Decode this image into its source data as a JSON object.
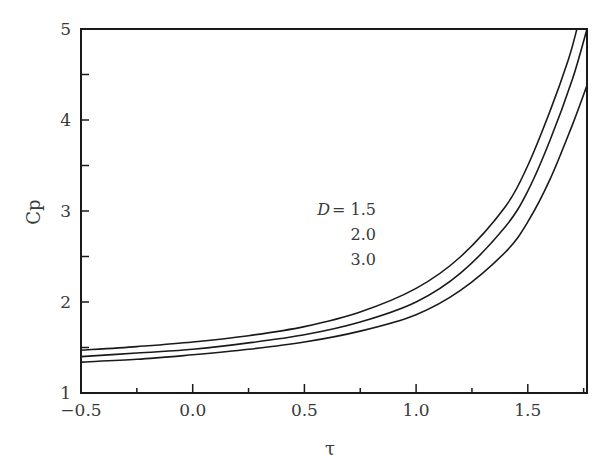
{
  "chart_data": {
    "type": "line",
    "title": "",
    "xlabel": "τ",
    "ylabel": "Cp",
    "xlim": [
      -0.5,
      1.765
    ],
    "ylim": [
      1,
      5
    ],
    "xticks": [
      -0.5,
      0.0,
      0.5,
      1.0,
      1.5
    ],
    "xtick_labels": [
      "−0.5",
      "0.0",
      "0.5",
      "1.0",
      "1.5"
    ],
    "yticks": [
      1,
      2,
      3,
      4,
      5
    ],
    "ytick_labels": [
      "1",
      "2",
      "3",
      "4",
      "5"
    ],
    "x_minor_step": 0.25,
    "y_minor_step": 0.5,
    "grid": false,
    "legend": "inline annotation",
    "annotation": {
      "prefix": "D",
      "equals": "= 1.5",
      "lines": [
        "2.0",
        "3.0"
      ]
    },
    "series": [
      {
        "name": "D = 1.5",
        "x": [
          -0.5,
          -0.25,
          0.0,
          0.25,
          0.5,
          0.75,
          1.0,
          1.2,
          1.4,
          1.5,
          1.6,
          1.68,
          1.72
        ],
        "y": [
          1.47,
          1.51,
          1.56,
          1.63,
          1.73,
          1.89,
          2.15,
          2.5,
          3.05,
          3.5,
          4.1,
          4.65,
          5.0
        ]
      },
      {
        "name": "D = 2.0",
        "x": [
          -0.5,
          -0.25,
          0.0,
          0.25,
          0.5,
          0.75,
          1.0,
          1.2,
          1.4,
          1.5,
          1.6,
          1.7,
          1.765
        ],
        "y": [
          1.4,
          1.44,
          1.48,
          1.55,
          1.64,
          1.78,
          2.0,
          2.32,
          2.83,
          3.22,
          3.78,
          4.45,
          5.0
        ]
      },
      {
        "name": "D = 3.0",
        "x": [
          -0.5,
          -0.25,
          0.0,
          0.25,
          0.5,
          0.75,
          1.0,
          1.2,
          1.4,
          1.5,
          1.6,
          1.7,
          1.765
        ],
        "y": [
          1.34,
          1.37,
          1.42,
          1.48,
          1.56,
          1.68,
          1.86,
          2.13,
          2.55,
          2.88,
          3.35,
          3.95,
          4.38
        ]
      }
    ]
  },
  "colors": {
    "axis": "#1a1a1a",
    "line": "#1a1a1a",
    "text": "#3a3a3a"
  }
}
